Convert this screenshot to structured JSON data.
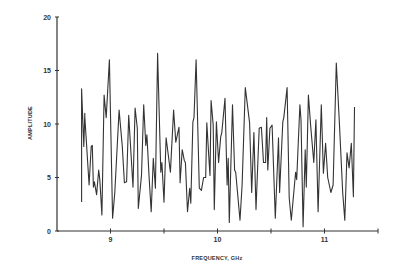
{
  "chart_data": {
    "type": "line",
    "title": "",
    "xlabel": "FREQUENCY, GHz",
    "ylabel": "AMPLITUDE",
    "xlim": [
      8.5,
      11.5
    ],
    "ylim": [
      0,
      20
    ],
    "grid": false,
    "legend": null,
    "x_ticks": [
      9,
      9.5,
      10,
      10.5,
      11,
      11.5
    ],
    "x_tick_labels": [
      "9",
      "",
      "10",
      "",
      "11",
      ""
    ],
    "y_ticks": [
      0,
      5,
      10,
      15,
      20
    ],
    "y_tick_labels": [
      "0",
      "5",
      "10",
      "15",
      "20"
    ],
    "series": [
      {
        "name": "amplitude",
        "color": "#333333",
        "x": [
          8.73,
          8.73,
          8.75,
          8.76,
          8.76,
          8.8,
          8.82,
          8.83,
          8.84,
          8.85,
          8.87,
          8.89,
          8.9,
          8.92,
          8.94,
          8.96,
          8.99,
          9.02,
          9.04,
          9.08,
          9.11,
          9.13,
          9.15,
          9.17,
          9.21,
          9.23,
          9.25,
          9.26,
          9.29,
          9.31,
          9.33,
          9.34,
          9.36,
          9.38,
          9.4,
          9.42,
          9.44,
          9.47,
          9.48,
          9.5,
          9.52,
          9.54,
          9.56,
          9.59,
          9.61,
          9.64,
          9.65,
          9.67,
          9.69,
          9.7,
          9.72,
          9.74,
          9.75,
          9.77,
          9.78,
          9.8,
          9.83,
          9.85,
          9.87,
          9.89,
          9.9,
          9.92,
          9.93,
          9.94,
          9.96,
          9.97,
          9.99,
          10.01,
          10.03,
          10.04,
          10.07,
          10.09,
          10.1,
          10.11,
          10.14,
          10.16,
          10.17,
          10.21,
          10.23,
          10.26,
          10.3,
          10.32,
          10.34,
          10.36,
          10.39,
          10.41,
          10.43,
          10.45,
          10.46,
          10.47,
          10.49,
          10.51,
          10.54,
          10.57,
          10.58,
          10.61,
          10.62,
          10.65,
          10.67,
          10.69,
          10.73,
          10.74,
          10.77,
          10.78,
          10.8,
          10.82,
          10.83,
          10.85,
          10.87,
          10.9,
          10.92,
          10.94,
          10.97,
          10.99,
          11.01,
          11.03,
          11.06,
          11.08,
          11.11,
          11.14,
          11.17,
          11.19,
          11.21,
          11.23,
          11.25,
          11.27,
          11.28
        ],
        "values": [
          2.7,
          13.3,
          7.9,
          11.0,
          10.7,
          4.3,
          7.9,
          8.0,
          4.1,
          4.6,
          3.4,
          5.7,
          4.8,
          1.5,
          12.7,
          10.6,
          16.0,
          1.2,
          3.6,
          11.3,
          7.9,
          4.5,
          4.6,
          10.8,
          4.1,
          11.5,
          9.6,
          2.1,
          5.2,
          11.8,
          8.0,
          9.0,
          5.2,
          1.8,
          6.8,
          4.0,
          16.6,
          5.5,
          6.4,
          2.7,
          8.7,
          7.1,
          5.5,
          11.3,
          8.3,
          9.7,
          4.5,
          7.6,
          6.6,
          6.4,
          1.8,
          4.0,
          2.6,
          10.2,
          10.6,
          16.0,
          4.0,
          3.8,
          5.0,
          5.0,
          10.1,
          6.8,
          5.2,
          12.2,
          9.9,
          2.0,
          10.2,
          6.4,
          8.8,
          9.2,
          12.4,
          4.3,
          6.8,
          0.8,
          11.8,
          5.7,
          5.5,
          1.0,
          4.3,
          13.4,
          10.1,
          3.6,
          9.2,
          2.0,
          9.6,
          9.7,
          6.4,
          6.4,
          10.6,
          5.7,
          9.6,
          9.9,
          1.2,
          8.7,
          3.6,
          10.2,
          10.6,
          13.4,
          3.1,
          1.0,
          5.5,
          4.8,
          11.8,
          10.4,
          0.4,
          7.6,
          4.1,
          12.7,
          9.9,
          6.4,
          10.4,
          1.8,
          11.8,
          5.4,
          8.2,
          5.0,
          3.6,
          4.3,
          15.7,
          9.9,
          3.6,
          1.0,
          7.3,
          5.9,
          8.2,
          3.2,
          11.6
        ]
      }
    ]
  },
  "axes": {
    "x_title": "FREQUENCY, GHz",
    "y_title": "AMPLITUDE"
  }
}
